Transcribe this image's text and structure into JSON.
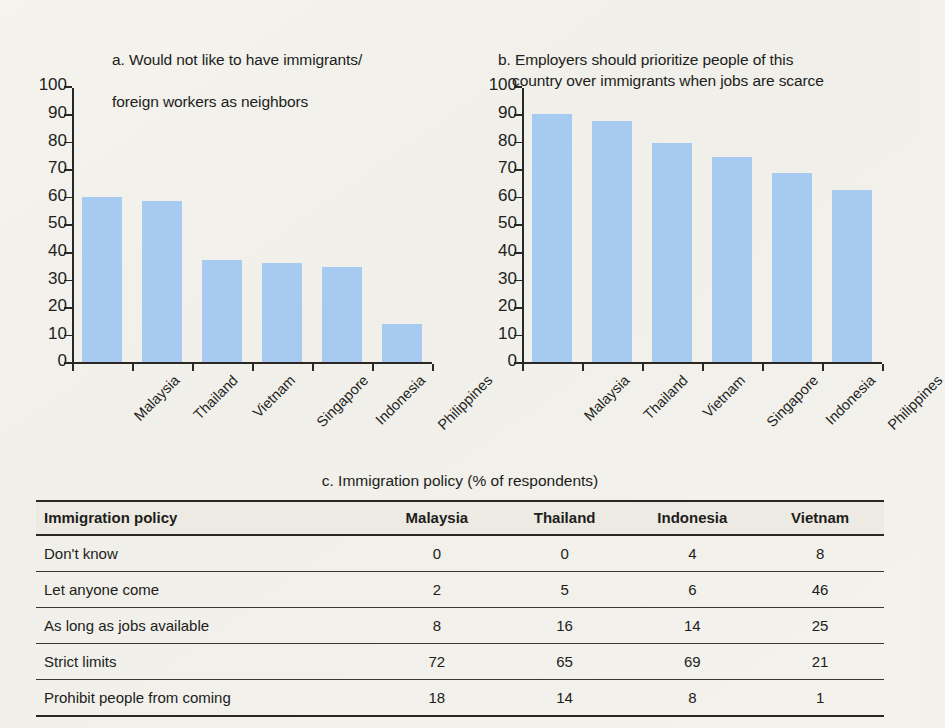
{
  "chart_data": [
    {
      "id": "a",
      "type": "bar",
      "title": "a. Would not like to have immigrants/\nforeign workers as neighbors",
      "label_prefix": "a.",
      "categories": [
        "Malaysia",
        "Thailand",
        "Vietnam",
        "Singapore",
        "Indonesia",
        "Philippines"
      ],
      "values": [
        60,
        58.5,
        37,
        36,
        34.5,
        14
      ],
      "xlabel": "",
      "ylabel": "",
      "ylim": [
        0,
        100
      ],
      "yticks": [
        0,
        10,
        20,
        30,
        40,
        50,
        60,
        70,
        80,
        90,
        100
      ],
      "grid": false,
      "legend": "none",
      "bar_color": "#a6caf0"
    },
    {
      "id": "b",
      "type": "bar",
      "title": "b. Employers should prioritize people of this\ncountry over immigrants when jobs are scarce",
      "title_line1": "b. Employers should prioritize people of this",
      "title_line2": "country over immigrants when jobs are scarce",
      "label_prefix": "b.",
      "categories": [
        "Malaysia",
        "Thailand",
        "Vietnam",
        "Singapore",
        "Indonesia",
        "Philippines"
      ],
      "values": [
        90,
        87.5,
        79.5,
        74.5,
        68.5,
        62.5
      ],
      "xlabel": "",
      "ylabel": "",
      "ylim": [
        0,
        100
      ],
      "yticks": [
        0,
        10,
        20,
        30,
        40,
        50,
        60,
        70,
        80,
        90,
        100
      ],
      "grid": false,
      "legend": "none",
      "bar_color": "#a6caf0"
    },
    {
      "id": "c",
      "type": "table",
      "title": "c. Immigration policy (% of respondents)",
      "columns": [
        "Immigration policy",
        "Malaysia",
        "Thailand",
        "Indonesia",
        "Vietnam"
      ],
      "rows": [
        {
          "policy": "Don't know",
          "values": [
            0,
            0,
            4,
            8
          ]
        },
        {
          "policy": "Let anyone come",
          "values": [
            2,
            5,
            6,
            46
          ]
        },
        {
          "policy": "As long as jobs available",
          "values": [
            8,
            16,
            14,
            25
          ]
        },
        {
          "policy": "Strict limits",
          "values": [
            72,
            65,
            69,
            21
          ]
        },
        {
          "policy": "Prohibit people from coming",
          "values": [
            18,
            14,
            8,
            1
          ]
        }
      ]
    }
  ],
  "panel_a": {
    "title_line1": "a. Would not like to have immigrants/",
    "title_line2": "foreign workers as neighbors"
  },
  "panel_b": {
    "title_line1": "b. Employers should prioritize people of this",
    "title_line2": "country over immigrants when jobs are scarce"
  },
  "table": {
    "caption": "c. Immigration policy (% of respondents)",
    "headers": [
      "Immigration policy",
      "Malaysia",
      "Thailand",
      "Indonesia",
      "Vietnam"
    ],
    "rows": [
      [
        "Don't know",
        "0",
        "0",
        "4",
        "8"
      ],
      [
        "Let anyone come",
        "2",
        "5",
        "6",
        "46"
      ],
      [
        "As long as jobs available",
        "8",
        "16",
        "14",
        "25"
      ],
      [
        "Strict limits",
        "72",
        "65",
        "69",
        "21"
      ],
      [
        "Prohibit people from coming",
        "18",
        "14",
        "8",
        "1"
      ]
    ]
  }
}
